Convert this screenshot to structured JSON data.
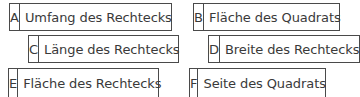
{
  "cards": [
    {
      "letter": "A",
      "text": "Umfang des Rechtecks"
    },
    {
      "letter": "B",
      "text": "Fläche des Quadrats"
    },
    {
      "letter": "C",
      "text": "Länge des Rechtecks"
    },
    {
      "letter": "D",
      "text": "Breite des Rechtecks"
    },
    {
      "letter": "E",
      "text": "Fläche des Rechtecks"
    },
    {
      "letter": "F",
      "text": "Seite des Quadrats"
    }
  ]
}
